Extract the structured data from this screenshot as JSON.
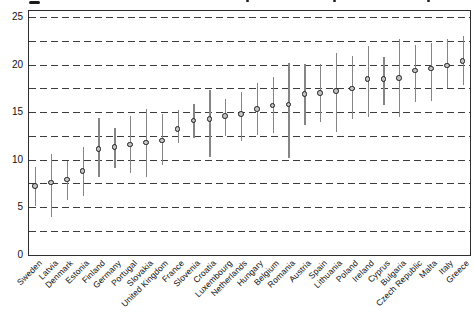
{
  "figure": {
    "background": "#ffffff",
    "cropped_caption_fragments": [
      {
        "x": 29,
        "y": 1,
        "w": 11,
        "h": 2.5
      },
      {
        "x": 246,
        "y": 0,
        "w": 3,
        "h": 2
      },
      {
        "x": 333,
        "y": 0,
        "w": 3,
        "h": 2
      },
      {
        "x": 427,
        "y": 0,
        "w": 3,
        "h": 2
      }
    ]
  },
  "colors": {
    "frame": "#2e2e2e",
    "gridline": "#3c3c3c",
    "error_bar": "#858585",
    "point_fill": "#c3c3c3",
    "point_stroke": "#1b1b1b",
    "text": "#111111"
  },
  "chart_data": {
    "type": "scatter",
    "title": "",
    "xlabel": "",
    "ylabel": "",
    "ylim": [
      0,
      25.7
    ],
    "gridline_step": 2.5,
    "grid": "horizontal dashed lines every 2.5 units",
    "legend": "none",
    "marker": "circle point estimate with vertical confidence-interval error bar, no caps",
    "ytick_labels": [
      "0",
      "5",
      "10",
      "15",
      "20",
      "25"
    ],
    "ytick_values": [
      0,
      5,
      10,
      15,
      20,
      25
    ],
    "categories": [
      "Sweden",
      "Latvia",
      "Denmark",
      "Estonia",
      "Finland",
      "Germany",
      "Portugal",
      "Slovakia",
      "United Kingdom",
      "France",
      "Slovenia",
      "Croatia",
      "Luxembourg",
      "Netherlands",
      "Hungary",
      "Belgium",
      "Romania",
      "Austria",
      "Spain",
      "Lithuania",
      "Poland",
      "Ireland",
      "Cyprus",
      "Bulgaria",
      "Czech Republic",
      "Malta",
      "Italy",
      "Greece"
    ],
    "points": [
      {
        "country": "Sweden",
        "value": 7.2,
        "ci_low": 5.2,
        "ci_high": 9.3
      },
      {
        "country": "Latvia",
        "value": 7.6,
        "ci_low": 4.0,
        "ci_high": 10.6
      },
      {
        "country": "Denmark",
        "value": 7.9,
        "ci_low": 5.8,
        "ci_high": 9.9
      },
      {
        "country": "Estonia",
        "value": 8.8,
        "ci_low": 6.2,
        "ci_high": 11.4
      },
      {
        "country": "Finland",
        "value": 11.1,
        "ci_low": 8.2,
        "ci_high": 14.4
      },
      {
        "country": "Germany",
        "value": 11.3,
        "ci_low": 9.2,
        "ci_high": 13.4
      },
      {
        "country": "Portugal",
        "value": 11.6,
        "ci_low": 8.6,
        "ci_high": 14.6
      },
      {
        "country": "Slovakia",
        "value": 11.8,
        "ci_low": 8.2,
        "ci_high": 15.4
      },
      {
        "country": "United Kingdom",
        "value": 12.0,
        "ci_low": 9.5,
        "ci_high": 14.9
      },
      {
        "country": "France",
        "value": 13.2,
        "ci_low": 11.8,
        "ci_high": 15.3
      },
      {
        "country": "Slovenia",
        "value": 14.1,
        "ci_low": 12.3,
        "ci_high": 15.9
      },
      {
        "country": "Croatia",
        "value": 14.3,
        "ci_low": 10.3,
        "ci_high": 17.4
      },
      {
        "country": "Luxembourg",
        "value": 14.6,
        "ci_low": 12.5,
        "ci_high": 16.4
      },
      {
        "country": "Netherlands",
        "value": 14.8,
        "ci_low": 12.0,
        "ci_high": 17.2
      },
      {
        "country": "Hungary",
        "value": 15.3,
        "ci_low": 12.6,
        "ci_high": 18.1
      },
      {
        "country": "Belgium",
        "value": 15.7,
        "ci_low": 12.9,
        "ci_high": 18.7
      },
      {
        "country": "Romania",
        "value": 15.8,
        "ci_low": 10.2,
        "ci_high": 20.2
      },
      {
        "country": "Austria",
        "value": 16.9,
        "ci_low": 13.7,
        "ci_high": 20.1
      },
      {
        "country": "Spain",
        "value": 17.0,
        "ci_low": 14.0,
        "ci_high": 20.1
      },
      {
        "country": "Lithuania",
        "value": 17.2,
        "ci_low": 13.0,
        "ci_high": 21.3
      },
      {
        "country": "Poland",
        "value": 17.5,
        "ci_low": 14.3,
        "ci_high": 21.0
      },
      {
        "country": "Ireland",
        "value": 18.5,
        "ci_low": 14.5,
        "ci_high": 22.0
      },
      {
        "country": "Cyprus",
        "value": 18.5,
        "ci_low": 15.8,
        "ci_high": 20.9
      },
      {
        "country": "Bulgaria",
        "value": 18.6,
        "ci_low": 14.5,
        "ci_high": 22.7
      },
      {
        "country": "Czech Republic",
        "value": 19.4,
        "ci_low": 16.1,
        "ci_high": 22.1
      },
      {
        "country": "Malta",
        "value": 19.6,
        "ci_low": 16.2,
        "ci_high": 22.3
      },
      {
        "country": "Italy",
        "value": 19.9,
        "ci_low": 17.6,
        "ci_high": 22.8
      },
      {
        "country": "Greece",
        "value": 20.4,
        "ci_low": 17.9,
        "ci_high": 23.1
      }
    ]
  }
}
